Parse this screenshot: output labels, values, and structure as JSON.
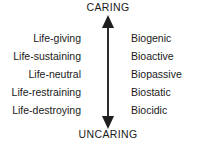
{
  "axis": {
    "top_label": "CARING",
    "bottom_label": "UNCARING",
    "arrow_style": "double-headed-vertical",
    "color": "#1a1a1a"
  },
  "columns": {
    "left": {
      "alignment": "right",
      "rows": [
        {
          "label": "Life-giving"
        },
        {
          "label": "Life-sustaining"
        },
        {
          "label": "Life-neutral"
        },
        {
          "label": "Life-restraining"
        },
        {
          "label": "Life-destroying"
        }
      ]
    },
    "right": {
      "alignment": "left",
      "rows": [
        {
          "label": "Biogenic"
        },
        {
          "label": "Bioactive"
        },
        {
          "label": "Biopassive"
        },
        {
          "label": "Biostatic"
        },
        {
          "label": "Biocidic"
        }
      ]
    }
  },
  "colors": {
    "background": "#ffffff",
    "text": "#1a1a1a",
    "arrow": "#2b2b2b"
  }
}
